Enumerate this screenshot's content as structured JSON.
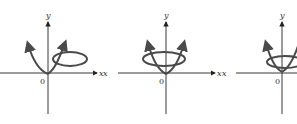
{
  "figures": [
    {
      "id": "panel-1",
      "axis_labels": {
        "x": "x",
        "y": "y",
        "origin": "0"
      },
      "description": "Parabola-like curve through origin with a loop on the right side"
    },
    {
      "id": "panel-2",
      "axis_labels": {
        "x": "x",
        "y": "y",
        "origin": "0"
      },
      "description": "Parabola-like curve through origin with a centered horizontal loop"
    },
    {
      "id": "panel-3",
      "axis_labels": {
        "x": "x",
        "y": "y",
        "origin": "0"
      },
      "description": "Parabola-like curve through origin with a loop, partially cropped at right edge"
    }
  ],
  "colors": {
    "axis": "#222222",
    "curve": "#4a4a4a",
    "background": "#ffffff"
  }
}
